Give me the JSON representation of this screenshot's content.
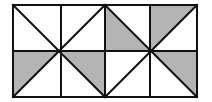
{
  "diagram": {
    "colors": {
      "background": "#ffffff",
      "line": "#111111",
      "shade": "#b4b4b4"
    },
    "frame": {
      "x": 13,
      "y": 5,
      "width": 184,
      "height": 92
    },
    "vertical_lines_x": [
      13,
      61,
      105,
      150,
      197
    ],
    "horizontal_lines_y": [
      5,
      51,
      97
    ],
    "centers": [
      {
        "x": 61,
        "y": 51
      },
      {
        "x": 150,
        "y": 51
      }
    ],
    "shaded_triangles": [
      {
        "name": "shaded-triangle-bottom-left-a",
        "points": "13,51 61,51 13,97"
      },
      {
        "name": "shaded-triangle-bottom-left-b",
        "points": "61,51 105,51 105,97"
      },
      {
        "name": "shaded-triangle-top-right-a",
        "points": "105,5 150,51 105,51"
      },
      {
        "name": "shaded-triangle-top-right-b",
        "points": "150,5 197,5 150,51"
      },
      {
        "name": "shaded-triangle-bottom-right",
        "points": "150,51 197,51 197,97"
      }
    ],
    "diagonals": [
      {
        "x1": 13,
        "y1": 5,
        "x2": 105,
        "y2": 97
      },
      {
        "x1": 105,
        "y1": 5,
        "x2": 13,
        "y2": 97
      },
      {
        "x1": 105,
        "y1": 5,
        "x2": 197,
        "y2": 97
      },
      {
        "x1": 197,
        "y1": 5,
        "x2": 105,
        "y2": 97
      }
    ]
  }
}
